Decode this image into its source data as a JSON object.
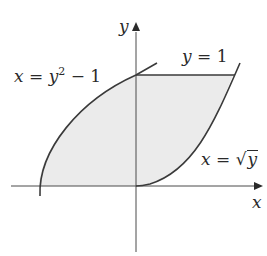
{
  "diagram": {
    "type": "region-between-curves",
    "axes": {
      "x_label": "x",
      "y_label": "y"
    },
    "curves": [
      {
        "id": "left-curve",
        "equation_lhs": "x",
        "equation_eq": " = ",
        "equation_rhs_base": "y",
        "equation_rhs_exp": "2",
        "equation_rhs_tail": " − 1"
      },
      {
        "id": "right-curve",
        "equation_lhs": "x",
        "equation_eq": " = ",
        "equation_sqrt_symbol": "√",
        "equation_sqrt_arg": "y"
      },
      {
        "id": "top-line",
        "equation_lhs": "y",
        "equation_eq": " = ",
        "equation_rhs": "1"
      }
    ],
    "colors": {
      "stroke": "#3a3a3a",
      "shade": "#e9e9e9",
      "axis": "#4a4a4a"
    }
  }
}
